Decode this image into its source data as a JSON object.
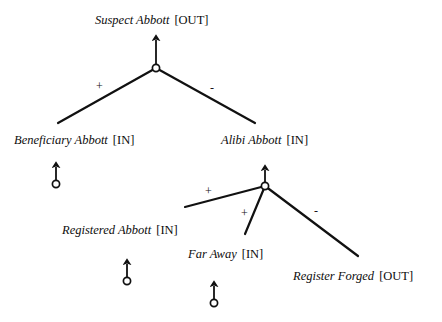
{
  "diagram": {
    "type": "argument-support-tree",
    "background_color": "#ffffff",
    "line_color": "#111111",
    "text_color": "#0d0d0d",
    "nodes": [
      {
        "id": "suspect",
        "name": "Suspect Abbott",
        "status": "[OUT]",
        "label_x": 95,
        "label_y": 14,
        "junction": {
          "x": 156,
          "y": 68,
          "arrow_tip_y": 33
        }
      },
      {
        "id": "beneficiary",
        "name": "Beneficiary Abbott",
        "status": "[IN]",
        "label_x": 14,
        "label_y": 134,
        "assumption": {
          "x": 56,
          "y": 184,
          "arrow_tip_y": 160
        }
      },
      {
        "id": "alibi",
        "name": "Alibi Abbott",
        "status": "[IN]",
        "label_x": 221,
        "label_y": 134,
        "junction": {
          "x": 265,
          "y": 186,
          "arrow_tip_y": 163
        }
      },
      {
        "id": "registered",
        "name": "Registered Abbott",
        "status": "[IN]",
        "label_x": 62,
        "label_y": 224,
        "assumption": {
          "x": 127,
          "y": 281,
          "arrow_tip_y": 256
        }
      },
      {
        "id": "faraway",
        "name": "Far Away",
        "status": "[IN]",
        "label_x": 188,
        "label_y": 248,
        "assumption": {
          "x": 214,
          "y": 303,
          "arrow_tip_y": 278
        }
      },
      {
        "id": "forged",
        "name": "Register Forged",
        "status": "[OUT]",
        "label_x": 293,
        "label_y": 270
      }
    ],
    "edges": [
      {
        "id": "beneficiary-supports-suspect",
        "from": "beneficiary",
        "to": "suspect",
        "sign": "+",
        "x1": 58,
        "y1": 123,
        "x2": 156,
        "y2": 68,
        "sign_x": 96,
        "sign_y": 80
      },
      {
        "id": "alibi-attacks-suspect",
        "from": "alibi",
        "to": "suspect",
        "sign": "-",
        "x1": 255,
        "y1": 123,
        "x2": 156,
        "y2": 68,
        "sign_x": 210,
        "sign_y": 82
      },
      {
        "id": "registered-supports-alibi",
        "from": "registered",
        "to": "alibi",
        "sign": "+",
        "x1": 185,
        "y1": 207,
        "x2": 265,
        "y2": 186,
        "sign_x": 205,
        "sign_y": 185
      },
      {
        "id": "faraway-supports-alibi",
        "from": "faraway",
        "to": "alibi",
        "sign": "+",
        "x1": 245,
        "y1": 234,
        "x2": 265,
        "y2": 186,
        "sign_x": 241,
        "sign_y": 207
      },
      {
        "id": "forged-attacks-alibi",
        "from": "forged",
        "to": "alibi",
        "sign": "-",
        "x1": 358,
        "y1": 256,
        "x2": 265,
        "y2": 186,
        "sign_x": 314,
        "sign_y": 205
      }
    ]
  }
}
